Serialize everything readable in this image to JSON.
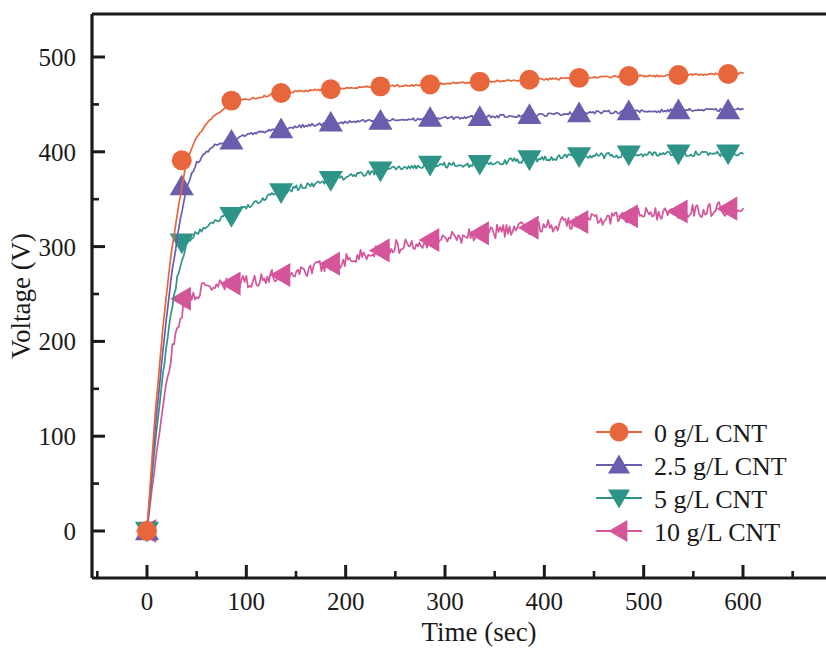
{
  "chart_data": {
    "type": "line",
    "title": "",
    "xlabel": "Time (sec)",
    "ylabel": "Voltage (V)",
    "xlim": [
      -40,
      640
    ],
    "ylim": [
      -45,
      560
    ],
    "xticks": [
      0,
      100,
      200,
      300,
      400,
      500,
      600
    ],
    "xticklabels": [
      "0",
      "100",
      "200",
      "300",
      "400",
      "500",
      "600"
    ],
    "yticks": [
      0,
      100,
      200,
      300,
      400,
      500
    ],
    "yticklabels": [
      "0",
      "100",
      "200",
      "300",
      "400",
      "500"
    ],
    "minor_xtick_interval": 50,
    "minor_ytick_interval": 50,
    "grid": false,
    "legend_position": "lower right",
    "axis_frame": "box-left-top-bottom",
    "series": [
      {
        "name": "0 g/L CNT",
        "color": "#E8663C",
        "marker": "circle",
        "noise": 1.0,
        "x": [
          0,
          8,
          16,
          24,
          32,
          40,
          50,
          60,
          70,
          85,
          100,
          115,
          135,
          155,
          185,
          215,
          235,
          265,
          285,
          315,
          335,
          365,
          385,
          415,
          435,
          465,
          485,
          515,
          535,
          565,
          585,
          600
        ],
        "y": [
          0,
          120,
          215,
          290,
          345,
          391,
          415,
          430,
          440,
          452,
          455,
          458,
          462,
          464,
          466,
          468,
          469,
          470,
          471,
          473,
          474,
          475,
          476,
          477,
          478,
          479,
          480,
          480,
          481,
          482,
          482,
          483
        ],
        "markers_x": [
          0,
          35,
          85,
          135,
          185,
          235,
          285,
          335,
          385,
          435,
          485,
          535,
          585
        ],
        "markers_y": [
          0,
          391,
          454,
          462,
          466,
          469,
          471,
          474,
          476,
          478,
          480,
          481,
          482
        ]
      },
      {
        "name": "2.5 g/L CNT",
        "color": "#6B5DAD",
        "marker": "triangle-up",
        "noise": 1.6,
        "x": [
          0,
          8,
          16,
          24,
          32,
          40,
          50,
          60,
          70,
          85,
          100,
          115,
          135,
          155,
          185,
          215,
          235,
          265,
          285,
          315,
          335,
          365,
          385,
          415,
          435,
          465,
          485,
          515,
          535,
          565,
          585,
          600
        ],
        "y": [
          0,
          105,
          190,
          265,
          320,
          364,
          388,
          400,
          408,
          413,
          418,
          421,
          424,
          427,
          430,
          432,
          433,
          434,
          435,
          436,
          437,
          438,
          438,
          440,
          441,
          442,
          442,
          443,
          444,
          444,
          444,
          445
        ],
        "markers_x": [
          0,
          35,
          85,
          135,
          185,
          235,
          285,
          335,
          385,
          435,
          485,
          535,
          585
        ],
        "markers_y": [
          0,
          364,
          412,
          424,
          431,
          433,
          436,
          437,
          439,
          441,
          443,
          444,
          444
        ]
      },
      {
        "name": "5 g/L CNT",
        "color": "#2E9488",
        "marker": "triangle-down",
        "noise": 3.0,
        "x": [
          0,
          8,
          16,
          24,
          32,
          40,
          50,
          60,
          70,
          85,
          100,
          115,
          135,
          155,
          185,
          215,
          235,
          265,
          285,
          315,
          335,
          365,
          385,
          415,
          435,
          465,
          485,
          515,
          535,
          565,
          585,
          600
        ],
        "y": [
          0,
          90,
          165,
          230,
          275,
          304,
          315,
          322,
          328,
          334,
          342,
          350,
          357,
          363,
          370,
          376,
          380,
          384,
          386,
          386,
          387,
          390,
          392,
          394,
          395,
          396,
          397,
          397,
          398,
          398,
          398,
          398
        ],
        "markers_x": [
          0,
          35,
          85,
          135,
          185,
          235,
          285,
          335,
          385,
          435,
          485,
          535,
          585
        ],
        "markers_y": [
          0,
          304,
          332,
          357,
          370,
          380,
          386,
          387,
          392,
          395,
          397,
          398,
          398
        ]
      },
      {
        "name": "10 g/L CNT",
        "color": "#D4559A",
        "marker": "triangle-left",
        "noise": 7.5,
        "x": [
          0,
          8,
          16,
          24,
          32,
          40,
          50,
          60,
          70,
          85,
          100,
          115,
          135,
          155,
          185,
          215,
          235,
          265,
          285,
          315,
          335,
          365,
          385,
          415,
          435,
          465,
          485,
          515,
          535,
          565,
          585,
          600
        ],
        "y": [
          0,
          70,
          130,
          185,
          222,
          245,
          252,
          256,
          258,
          260,
          263,
          266,
          270,
          274,
          282,
          290,
          296,
          303,
          307,
          311,
          314,
          318,
          320,
          324,
          326,
          330,
          332,
          335,
          337,
          339,
          340,
          340
        ],
        "markers_x": [
          0,
          35,
          85,
          135,
          185,
          235,
          285,
          335,
          385,
          435,
          485,
          535,
          585
        ],
        "markers_y": [
          0,
          245,
          261,
          270,
          282,
          296,
          307,
          314,
          320,
          326,
          332,
          337,
          340
        ]
      }
    ]
  },
  "legend": {
    "entries": [
      {
        "label": "0 g/L CNT",
        "color": "#E8663C",
        "marker": "circle"
      },
      {
        "label": "2.5 g/L CNT",
        "color": "#6B5DAD",
        "marker": "triangle-up"
      },
      {
        "label": "5 g/L CNT",
        "color": "#2E9488",
        "marker": "triangle-down"
      },
      {
        "label": "10 g/L CNT",
        "color": "#D4559A",
        "marker": "triangle-left"
      }
    ]
  }
}
